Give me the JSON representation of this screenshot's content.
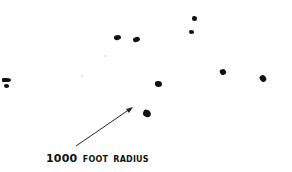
{
  "diagram": {
    "annotation": {
      "number": "1000",
      "words": [
        "FOOT",
        "RADIUS"
      ]
    },
    "markers": [
      {
        "x": 117,
        "y": 37,
        "w": 7,
        "h": 5
      },
      {
        "x": 136,
        "y": 39,
        "w": 7,
        "h": 5
      },
      {
        "x": 194,
        "y": 19,
        "w": 5,
        "h": 5
      },
      {
        "x": 191,
        "y": 32,
        "w": 5,
        "h": 5
      },
      {
        "x": 158,
        "y": 84,
        "w": 7,
        "h": 6
      },
      {
        "x": 147,
        "y": 113,
        "w": 8,
        "h": 7
      },
      {
        "x": 223,
        "y": 72,
        "w": 6,
        "h": 6
      },
      {
        "x": 263,
        "y": 78,
        "w": 6,
        "h": 7
      },
      {
        "x": 7,
        "y": 80,
        "w": 9,
        "h": 4
      },
      {
        "x": 6,
        "y": 86,
        "w": 5,
        "h": 4
      }
    ],
    "arrow": {
      "x1": 76,
      "y1": 146,
      "x2": 132,
      "y2": 108
    },
    "colors": {
      "ink": "#111111",
      "background": "#ffffff"
    }
  }
}
